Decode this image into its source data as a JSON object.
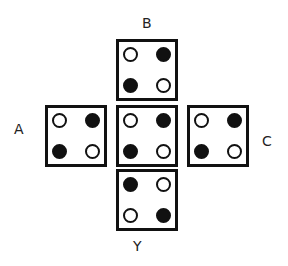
{
  "labels": {
    "B": "B",
    "A": "A",
    "C": "C",
    "Y": "Y"
  },
  "faces": {
    "top": {
      "name": "B",
      "dots": {
        "tl": "empty",
        "tr": "filled",
        "bl": "filled",
        "br": "empty"
      }
    },
    "left": {
      "name": "A",
      "dots": {
        "tl": "empty",
        "tr": "filled",
        "bl": "filled",
        "br": "empty"
      }
    },
    "center": {
      "name": "center",
      "dots": {
        "tl": "empty",
        "tr": "filled",
        "bl": "filled",
        "br": "empty"
      }
    },
    "right": {
      "name": "C",
      "dots": {
        "tl": "empty",
        "tr": "filled",
        "bl": "filled",
        "br": "empty"
      }
    },
    "bottom": {
      "name": "Y",
      "dots": {
        "tl": "filled",
        "tr": "empty",
        "bl": "empty",
        "br": "filled"
      }
    }
  }
}
